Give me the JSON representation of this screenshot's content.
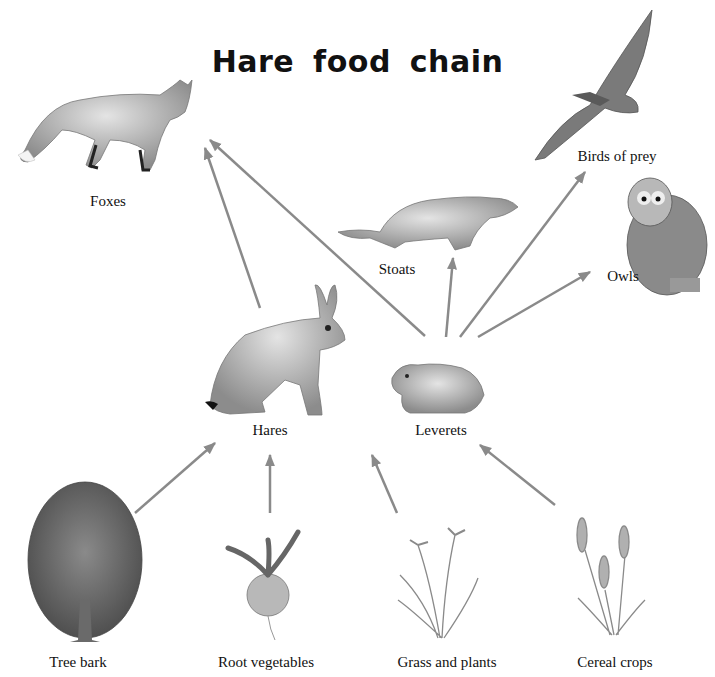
{
  "title": "Hare food chain",
  "organisms": {
    "foxes": "Foxes",
    "birds_of_prey": "Birds of prey",
    "stoats": "Stoats",
    "owls": "Owls",
    "hares": "Hares",
    "leverets": "Leverets",
    "tree_bark": "Tree bark",
    "root_vegetables": "Root vegetables",
    "grass_and_plants": "Grass and plants",
    "cereal_crops": "Cereal crops"
  },
  "links": [
    {
      "from": "Tree bark",
      "to": "Hares"
    },
    {
      "from": "Root vegetables",
      "to": "Hares"
    },
    {
      "from": "Grass and plants",
      "to": "Leverets"
    },
    {
      "from": "Cereal crops",
      "to": "Leverets"
    },
    {
      "from": "Hares",
      "to": "Foxes"
    },
    {
      "from": "Leverets",
      "to": "Foxes"
    },
    {
      "from": "Leverets",
      "to": "Stoats"
    },
    {
      "from": "Leverets",
      "to": "Birds of prey"
    },
    {
      "from": "Leverets",
      "to": "Owls"
    }
  ],
  "colors": {
    "arrow": "#8a8a8a",
    "illustration": "#9a9a9a",
    "text": "#111111"
  }
}
